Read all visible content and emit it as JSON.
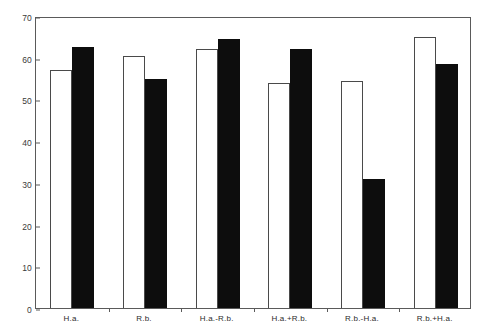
{
  "chart_data": {
    "type": "bar",
    "title": "",
    "subtitle": "",
    "xlabel": "",
    "ylabel": "",
    "ylim": [
      0,
      70
    ],
    "yticks": [
      0,
      10,
      20,
      30,
      40,
      50,
      60,
      70
    ],
    "ytick_labels": [
      "0",
      "10",
      "20",
      "30",
      "40",
      "50",
      "60",
      "70"
    ],
    "grid": false,
    "legend": false,
    "legend_position": "none",
    "categories": [
      "H.a.",
      "R.b.",
      "H.a.-R.b.",
      "H.a.+R.b.",
      "R.b.-H.a.",
      "R.b.+H.a."
    ],
    "series": [
      {
        "name": "white",
        "fill": "#ffffff",
        "edge": "#4a4a4a",
        "values": [
          57,
          60.5,
          62,
          54,
          54.5,
          65
        ]
      },
      {
        "name": "black",
        "fill": "#0d0d0d",
        "edge": "#0d0d0d",
        "values": [
          62.5,
          55,
          64.5,
          62,
          31,
          58.5
        ]
      }
    ]
  },
  "axes": {
    "y_axis_name": "y-axis",
    "x_axis_name": "x-axis"
  }
}
